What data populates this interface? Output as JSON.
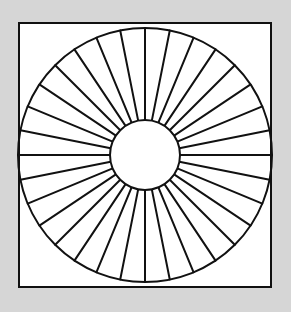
{
  "figure": {
    "spoke_count": 32,
    "colors": {
      "background": "#d6d6d6",
      "paper": "#ffffff",
      "ink": "#111111"
    }
  }
}
